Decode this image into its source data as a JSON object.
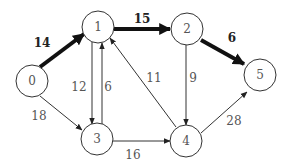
{
  "graph": {
    "title": "",
    "nodes": [
      {
        "id": "0",
        "label": "0",
        "x": 32,
        "y": 81
      },
      {
        "id": "1",
        "label": "1",
        "x": 98,
        "y": 27
      },
      {
        "id": "2",
        "label": "2",
        "x": 187,
        "y": 29
      },
      {
        "id": "3",
        "label": "3",
        "x": 97,
        "y": 139
      },
      {
        "id": "4",
        "label": "4",
        "x": 186,
        "y": 141
      },
      {
        "id": "5",
        "label": "5",
        "x": 260,
        "y": 75
      }
    ],
    "edges": [
      {
        "from": "0",
        "to": "1",
        "weight": "14",
        "highlighted": true
      },
      {
        "from": "1",
        "to": "2",
        "weight": "15",
        "highlighted": true
      },
      {
        "from": "2",
        "to": "5",
        "weight": "6",
        "highlighted": true
      },
      {
        "from": "0",
        "to": "3",
        "weight": "18",
        "highlighted": false
      },
      {
        "from": "1",
        "to": "3",
        "weight": "12",
        "highlighted": false
      },
      {
        "from": "3",
        "to": "1",
        "weight": "6",
        "highlighted": false
      },
      {
        "from": "4",
        "to": "1",
        "weight": "11",
        "highlighted": false
      },
      {
        "from": "2",
        "to": "4",
        "weight": "9",
        "highlighted": false
      },
      {
        "from": "3",
        "to": "4",
        "weight": "16",
        "highlighted": false
      },
      {
        "from": "4",
        "to": "5",
        "weight": "28",
        "highlighted": false
      }
    ],
    "colors": {
      "edge": "#333333",
      "highlight_edge": "#111111",
      "node_stroke": "#333333",
      "text": "#555555"
    }
  }
}
